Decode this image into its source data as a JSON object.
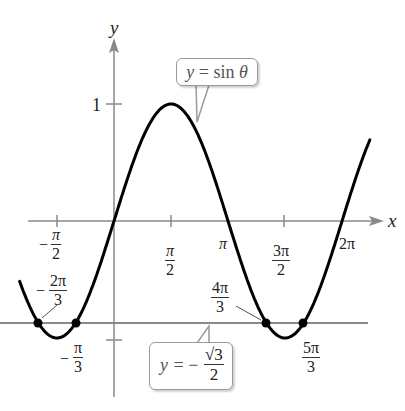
{
  "chart_data": {
    "type": "line",
    "title": "",
    "xlabel": "x",
    "ylabel": "y",
    "series": [
      {
        "name": "y = sin θ",
        "function": "sin",
        "x_range": [
          -2.6,
          7.05
        ],
        "color": "#000000"
      },
      {
        "name": "y = −√3/2",
        "function": "constant",
        "value": -0.866,
        "x_range": [
          -3.1,
          6.6
        ],
        "color": "#888888"
      }
    ],
    "x_ticks": [
      {
        "value": -1.5708,
        "label": "−π/2"
      },
      {
        "value": 1.5708,
        "label": "π/2"
      },
      {
        "value": 3.1416,
        "label": "π"
      },
      {
        "value": 4.7124,
        "label": "3π/2"
      },
      {
        "value": 6.2832,
        "label": "2π"
      }
    ],
    "y_ticks": [
      {
        "value": 1,
        "label": "1"
      },
      {
        "value": -0.866,
        "label": ""
      }
    ],
    "intersection_points": [
      {
        "x": -2.0944,
        "y": -0.866,
        "label": "−2π/3"
      },
      {
        "x": -1.0472,
        "y": -0.866,
        "label": "−π/3"
      },
      {
        "x": 4.1888,
        "y": -0.866,
        "label": "4π/3"
      },
      {
        "x": 5.236,
        "y": -0.866,
        "label": "5π/3"
      }
    ],
    "annotations": [
      {
        "text": "y = sin θ",
        "target": "curve"
      },
      {
        "text": "y = −√3/2",
        "target": "horizontal line"
      }
    ],
    "grid": false,
    "legend": "none"
  },
  "labels": {
    "x_axis": "x",
    "y_axis": "y",
    "y_one": "1",
    "callout_sin": {
      "y": "y",
      "eq": " = sin ",
      "theta": "θ"
    },
    "callout_line": {
      "y": "y",
      "eq": " = −",
      "num": "√3",
      "den": "2"
    },
    "tick_neg_pi_2": {
      "sign": "−",
      "num": "π",
      "den": "2"
    },
    "tick_pi_2": {
      "num": "π",
      "den": "2"
    },
    "tick_pi": "π",
    "tick_3pi_2": {
      "num": "3π",
      "den": "2"
    },
    "tick_2pi": "2π",
    "pt_neg_2pi_3": {
      "sign": "−",
      "num": "2π",
      "den": "3"
    },
    "pt_neg_pi_3": {
      "sign": "−",
      "num": "π",
      "den": "3"
    },
    "pt_4pi_3": {
      "num": "4π",
      "den": "3"
    },
    "pt_5pi_3": {
      "num": "5π",
      "den": "3"
    }
  }
}
